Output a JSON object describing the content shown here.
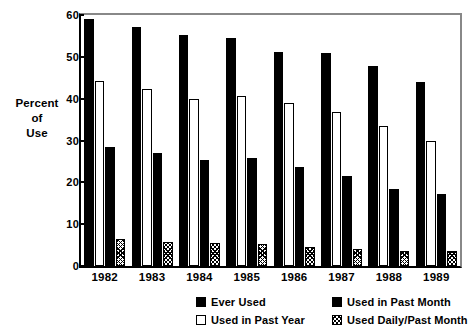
{
  "chart_data": {
    "type": "bar",
    "title": "",
    "subtitle": "",
    "xlabel": "",
    "ylabel": "Percent of Use",
    "ylabel_lines": [
      "Percent",
      "of",
      "Use"
    ],
    "categories": [
      "1982",
      "1983",
      "1984",
      "1985",
      "1986",
      "1987",
      "1988",
      "1989"
    ],
    "ylim": [
      0,
      60
    ],
    "yticks": [
      0,
      10,
      20,
      30,
      40,
      50,
      60
    ],
    "ytick_labels": [
      "0",
      "10",
      "20",
      "30",
      "40",
      "50",
      "60"
    ],
    "grid": false,
    "legend_position": "bottom",
    "series": [
      {
        "name": "Ever Used",
        "style": "solid-black",
        "values": [
          59.0,
          57.2,
          55.2,
          54.6,
          51.2,
          50.9,
          47.8,
          43.9
        ]
      },
      {
        "name": "Used in Past Year",
        "style": "white-outline",
        "values": [
          44.3,
          42.3,
          40.0,
          40.6,
          39.0,
          36.8,
          33.5,
          29.9
        ]
      },
      {
        "name": "Used in Past Month",
        "style": "solid-black",
        "values": [
          28.5,
          27.0,
          25.4,
          25.9,
          23.7,
          21.5,
          18.5,
          17.1
        ]
      },
      {
        "name": "Used Daily/Past Month",
        "style": "hatched",
        "values": [
          6.5,
          5.8,
          5.5,
          5.2,
          4.5,
          4.0,
          3.6,
          3.6
        ]
      }
    ],
    "colors": {
      "bar_fill": "#000000",
      "bar_outline": "#000000",
      "background": "#ffffff",
      "axis": "#000000"
    }
  },
  "legend": {
    "entries": [
      {
        "label": "Ever Used",
        "swatch": "solid-swatch"
      },
      {
        "label": "Used in Past Month",
        "swatch": "solid-swatch"
      },
      {
        "label": "Used in Past Year",
        "swatch": "outline-swatch"
      },
      {
        "label": "Used Daily/Past Month",
        "swatch": "hatch-swatch"
      }
    ]
  }
}
